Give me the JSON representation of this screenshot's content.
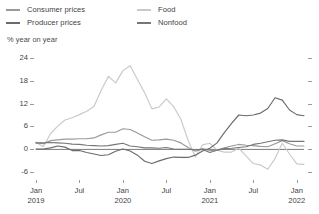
{
  "legend": {
    "items": [
      {
        "label": "Consumer prices",
        "color": "#9a9a9a"
      },
      {
        "label": "Producer prices",
        "color": "#6b6b6b"
      },
      {
        "label": "Food",
        "color": "#c9c9c9"
      },
      {
        "label": "Nonfood",
        "color": "#767676"
      }
    ]
  },
  "axis_title": "% year on year",
  "chart_data": {
    "type": "line",
    "title": "",
    "subtitle": "",
    "xlabel": "",
    "ylabel": "% year on year",
    "ylim": [
      -8,
      26
    ],
    "yticks": [
      24,
      18,
      12,
      6,
      0,
      -6
    ],
    "ytick_labels": [
      "24",
      "18",
      "12",
      "6",
      "0",
      "-6"
    ],
    "grid": false,
    "legend_position": "top",
    "xtick_labels": [
      {
        "l1": "Jan",
        "l2": "2019"
      },
      {
        "l1": "Jul",
        "l2": ""
      },
      {
        "l1": "Jan",
        "l2": "2020"
      },
      {
        "l1": "Jul",
        "l2": ""
      },
      {
        "l1": "Jan",
        "l2": "2021"
      },
      {
        "l1": "Jul",
        "l2": ""
      },
      {
        "l1": "Jan",
        "l2": "2022"
      }
    ],
    "x": [
      "2019-01",
      "2019-02",
      "2019-03",
      "2019-04",
      "2019-05",
      "2019-06",
      "2019-07",
      "2019-08",
      "2019-09",
      "2019-10",
      "2019-11",
      "2019-12",
      "2020-01",
      "2020-02",
      "2020-03",
      "2020-04",
      "2020-05",
      "2020-06",
      "2020-07",
      "2020-08",
      "2020-09",
      "2020-10",
      "2020-11",
      "2020-12",
      "2021-01",
      "2021-02",
      "2021-03",
      "2021-04",
      "2021-05",
      "2021-06",
      "2021-07",
      "2021-08",
      "2021-09",
      "2021-10",
      "2021-11",
      "2021-12",
      "2022-01",
      "2022-02"
    ],
    "series": [
      {
        "name": "Consumer prices",
        "color": "#9a9a9a",
        "values": [
          1.7,
          1.5,
          2.3,
          2.5,
          2.7,
          2.7,
          2.8,
          2.8,
          3.0,
          3.8,
          4.5,
          4.5,
          5.4,
          5.2,
          4.3,
          3.3,
          2.4,
          2.5,
          2.7,
          2.4,
          1.7,
          0.5,
          -0.5,
          0.2,
          -0.3,
          -0.2,
          0.4,
          0.9,
          1.3,
          1.1,
          1.0,
          0.8,
          0.7,
          1.5,
          2.3,
          1.5,
          0.9,
          0.9
        ]
      },
      {
        "name": "Producer prices",
        "color": "#6b6b6b",
        "values": [
          0.1,
          0.1,
          0.4,
          0.9,
          0.6,
          -0.3,
          -0.3,
          -0.8,
          -1.2,
          -1.6,
          -1.4,
          -0.5,
          0.1,
          -0.4,
          -1.5,
          -3.1,
          -3.7,
          -3.0,
          -2.4,
          -2.0,
          -2.1,
          -2.1,
          -1.5,
          -0.4,
          0.3,
          1.7,
          4.4,
          6.8,
          9.0,
          8.8,
          9.0,
          9.5,
          10.7,
          13.5,
          12.9,
          10.3,
          9.1,
          8.8
        ]
      },
      {
        "name": "Food",
        "color": "#c9c9c9",
        "values": [
          1.9,
          0.7,
          4.1,
          6.1,
          7.7,
          8.3,
          9.1,
          10.0,
          11.2,
          15.5,
          19.1,
          17.4,
          20.6,
          21.9,
          18.3,
          14.8,
          10.6,
          11.1,
          13.2,
          11.2,
          7.9,
          2.4,
          -2.0,
          1.2,
          1.6,
          -0.2,
          -0.7,
          -0.7,
          0.3,
          -1.7,
          -3.7,
          -4.1,
          -5.2,
          -2.4,
          1.6,
          -1.2,
          -3.8,
          -3.9
        ]
      },
      {
        "name": "Nonfood",
        "color": "#767676",
        "values": [
          1.7,
          1.7,
          1.8,
          1.7,
          1.6,
          1.4,
          1.3,
          1.1,
          1.0,
          0.9,
          1.0,
          1.3,
          1.6,
          0.9,
          0.7,
          0.4,
          0.4,
          0.3,
          0.5,
          0.1,
          0.0,
          0.0,
          -0.1,
          0.0,
          -0.8,
          -0.2,
          0.2,
          0.3,
          0.5,
          0.7,
          1.3,
          1.6,
          2.0,
          2.4,
          2.5,
          2.1,
          2.1,
          2.1
        ]
      }
    ]
  }
}
